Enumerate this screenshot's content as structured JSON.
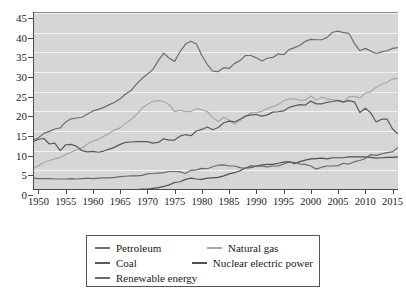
{
  "top_caption": "",
  "chart_data": {
    "type": "line",
    "title": "",
    "xlabel": "",
    "ylabel": "",
    "xlim": [
      1949,
      2016
    ],
    "ylim": [
      0,
      45
    ],
    "yticks": [
      0,
      5,
      10,
      15,
      20,
      25,
      30,
      35,
      40,
      45
    ],
    "xticks": [
      1950,
      1955,
      1960,
      1965,
      1970,
      1975,
      1980,
      1985,
      1990,
      1995,
      2000,
      2005,
      2010,
      2015
    ],
    "grid": true,
    "legend_position": "below",
    "x": [
      1949,
      1950,
      1951,
      1952,
      1953,
      1954,
      1955,
      1956,
      1957,
      1958,
      1959,
      1960,
      1961,
      1962,
      1963,
      1964,
      1965,
      1966,
      1967,
      1968,
      1969,
      1970,
      1971,
      1972,
      1973,
      1974,
      1975,
      1976,
      1977,
      1978,
      1979,
      1980,
      1981,
      1982,
      1983,
      1984,
      1985,
      1986,
      1987,
      1988,
      1989,
      1990,
      1991,
      1992,
      1993,
      1994,
      1995,
      1996,
      1997,
      1998,
      1999,
      2000,
      2001,
      2002,
      2003,
      2004,
      2005,
      2006,
      2007,
      2008,
      2009,
      2010,
      2011,
      2012,
      2013,
      2014,
      2015,
      2016
    ],
    "series": [
      {
        "name": "Petroleum",
        "color": "#6e6e6e",
        "values": [
          12.7,
          13.3,
          14.4,
          14.9,
          15.5,
          15.8,
          17.3,
          18.1,
          18.3,
          18.5,
          19.3,
          20.1,
          20.5,
          21.0,
          21.7,
          22.3,
          23.2,
          24.4,
          25.3,
          26.9,
          28.3,
          29.5,
          30.6,
          32.9,
          34.8,
          33.5,
          32.7,
          35.2,
          37.1,
          37.8,
          37.1,
          34.2,
          31.9,
          30.2,
          30.1,
          31.1,
          30.9,
          32.2,
          32.9,
          34.2,
          34.2,
          33.6,
          32.8,
          33.5,
          33.7,
          34.6,
          34.4,
          35.7,
          36.2,
          36.8,
          37.8,
          38.3,
          38.2,
          38.2,
          38.8,
          40.1,
          40.4,
          40.0,
          39.8,
          37.3,
          35.4,
          36.0,
          35.3,
          34.7,
          35.1,
          35.4,
          36.0,
          36.2
        ]
      },
      {
        "name": "Natural gas",
        "color": "#a8a8a8",
        "values": [
          5.4,
          6.2,
          7.0,
          7.5,
          7.9,
          8.3,
          9.0,
          9.6,
          10.2,
          10.7,
          11.7,
          12.4,
          12.9,
          13.7,
          14.4,
          15.3,
          15.8,
          17.0,
          17.9,
          19.2,
          20.7,
          21.8,
          22.5,
          22.7,
          22.5,
          21.7,
          19.9,
          20.3,
          19.9,
          20.0,
          20.7,
          20.4,
          19.9,
          18.4,
          17.4,
          18.5,
          17.8,
          16.7,
          17.7,
          18.6,
          19.7,
          19.6,
          20.0,
          20.7,
          21.2,
          21.7,
          22.7,
          23.1,
          23.2,
          22.8,
          22.9,
          23.9,
          22.9,
          23.6,
          23.1,
          23.0,
          22.6,
          22.2,
          23.7,
          23.8,
          23.4,
          24.6,
          25.0,
          26.1,
          26.9,
          27.4,
          28.2,
          28.4
        ]
      },
      {
        "name": "Coal",
        "color": "#5a5a5a",
        "values": [
          12.3,
          12.9,
          13.1,
          11.7,
          11.9,
          10.0,
          11.5,
          11.6,
          11.1,
          10.0,
          9.7,
          9.8,
          9.6,
          9.9,
          10.4,
          10.9,
          11.6,
          12.1,
          12.2,
          12.3,
          12.3,
          12.3,
          11.9,
          12.1,
          13.0,
          12.7,
          12.7,
          13.7,
          14.1,
          13.8,
          15.0,
          15.4,
          16.0,
          15.3,
          15.9,
          17.1,
          17.5,
          17.3,
          18.0,
          18.8,
          19.1,
          19.2,
          18.8,
          19.1,
          19.8,
          19.9,
          20.1,
          21.0,
          21.4,
          21.7,
          21.6,
          22.6,
          21.9,
          21.9,
          22.3,
          22.5,
          22.8,
          22.4,
          22.7,
          22.4,
          19.7,
          20.8,
          19.6,
          17.3,
          18.0,
          18.0,
          15.5,
          14.2
        ]
      },
      {
        "name": "Nuclear electric power",
        "color": "#4f4f4f",
        "values": [
          0.0,
          0.0,
          0.0,
          0.0,
          0.0,
          0.0,
          0.0,
          0.0,
          0.0,
          0.0,
          0.0,
          0.0,
          0.0,
          0.0,
          0.0,
          0.0,
          0.0,
          0.0,
          0.1,
          0.1,
          0.2,
          0.2,
          0.4,
          0.6,
          0.9,
          1.3,
          1.9,
          2.1,
          2.7,
          3.0,
          2.8,
          2.7,
          3.0,
          3.1,
          3.2,
          3.6,
          4.1,
          4.4,
          4.9,
          5.6,
          5.7,
          6.1,
          6.4,
          6.5,
          6.5,
          6.8,
          7.1,
          7.2,
          6.7,
          7.2,
          7.6,
          7.9,
          8.0,
          8.1,
          7.9,
          8.2,
          8.2,
          8.2,
          8.4,
          8.4,
          8.4,
          8.4,
          8.3,
          8.1,
          8.2,
          8.3,
          8.3,
          8.4
        ]
      },
      {
        "name": "Renewable energy",
        "color": "#6a6a6a",
        "values": [
          3.0,
          2.9,
          2.9,
          2.9,
          2.8,
          2.8,
          2.8,
          2.9,
          2.8,
          2.9,
          3.0,
          2.9,
          3.0,
          3.1,
          3.1,
          3.2,
          3.4,
          3.5,
          3.6,
          3.6,
          3.7,
          4.1,
          4.2,
          4.3,
          4.4,
          4.7,
          4.7,
          4.6,
          4.2,
          5.0,
          5.1,
          5.5,
          5.4,
          5.9,
          6.3,
          6.4,
          6.1,
          6.1,
          5.7,
          5.5,
          6.2,
          6.0,
          6.1,
          5.9,
          6.1,
          6.1,
          6.6,
          7.1,
          7.0,
          6.6,
          6.5,
          6.1,
          5.3,
          5.8,
          6.1,
          6.1,
          6.2,
          6.8,
          6.6,
          7.2,
          7.5,
          8.0,
          9.0,
          8.8,
          9.2,
          9.5,
          9.7,
          10.8
        ]
      }
    ]
  },
  "legend": {
    "entries": [
      {
        "label": "Petroleum",
        "color": "#6e6e6e"
      },
      {
        "label": "Natural gas",
        "color": "#a8a8a8"
      },
      {
        "label": "Coal",
        "color": "#5a5a5a"
      },
      {
        "label": "Nuclear electric power",
        "color": "#4f4f4f"
      },
      {
        "label": "Renewable energy",
        "color": "#6a6a6a"
      }
    ]
  }
}
